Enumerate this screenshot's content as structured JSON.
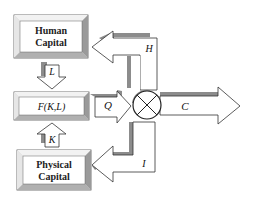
{
  "diagram": {
    "boxes": {
      "human_capital": {
        "line1": "Human",
        "line2": "Capital"
      },
      "production": {
        "label": "F(K,L)"
      },
      "physical_capital": {
        "line1": "Physical",
        "line2": "Capital"
      }
    },
    "arrows": {
      "labor": "L",
      "capital": "K",
      "output": "Q",
      "consumption": "C",
      "human_investment": "H",
      "physical_investment": "I"
    },
    "node": {
      "symbol": "otimes",
      "meaning": "allocation node"
    },
    "colors": {
      "box_fill": "#ffffff",
      "bevel_light": "#e8e8e8",
      "bevel_dark": "#8a8a8a",
      "shadow": "#8c8c8c",
      "stroke": "#333333"
    }
  }
}
